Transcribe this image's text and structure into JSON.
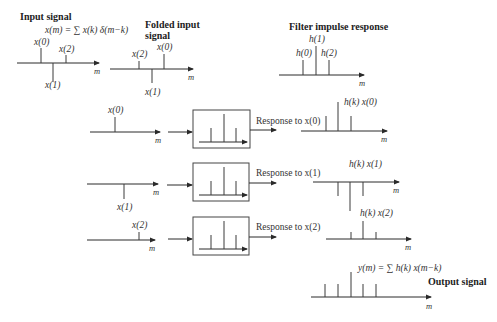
{
  "titles": {
    "input_signal": "Input signal",
    "folded_line1": "Folded input",
    "folded_line2": "signal",
    "filter": "Filter impulse response",
    "output": "Output signal"
  },
  "equations": {
    "input": "x(m) = ∑ x(k) δ(m−k)",
    "output": "y(m) = ∑ h(k) x(m−k)"
  },
  "axis_label": "m",
  "input_samples": {
    "x0": "x(0)",
    "x1": "x(1)",
    "x2": "x(2)"
  },
  "filter_samples": {
    "h0": "h(0)",
    "h1": "h(1)",
    "h2": "h(2)"
  },
  "rows": [
    {
      "input_label": "x(0)",
      "response_label": "Response to x(0)",
      "product_label": "h(k) x(0)"
    },
    {
      "input_label": "x(1)",
      "response_label": "Response to x(1)",
      "product_label": "h(k) x(1)"
    },
    {
      "input_label": "x(2)",
      "response_label": "Response to x(2)",
      "product_label": "h(k) x(2)"
    }
  ]
}
